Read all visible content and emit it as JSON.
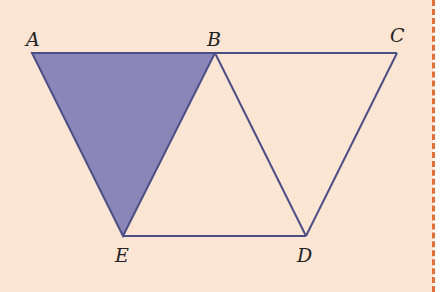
{
  "diagram": {
    "type": "geometry",
    "points": {
      "A": {
        "label": "A",
        "x": 32,
        "y": 53
      },
      "B": {
        "label": "B",
        "x": 215,
        "y": 53
      },
      "C": {
        "label": "C",
        "x": 397,
        "y": 53
      },
      "D": {
        "label": "D",
        "x": 306,
        "y": 236
      },
      "E": {
        "label": "E",
        "x": 123,
        "y": 236
      }
    },
    "segments": [
      "AB",
      "BC",
      "CD",
      "DE",
      "EA",
      "BE",
      "BD"
    ],
    "shaded_region": [
      "A",
      "B",
      "E"
    ],
    "colors": {
      "background": "#fde5d4",
      "line": "#4a4f86",
      "shade": "#8a86b8",
      "border": "#e0703a"
    }
  }
}
